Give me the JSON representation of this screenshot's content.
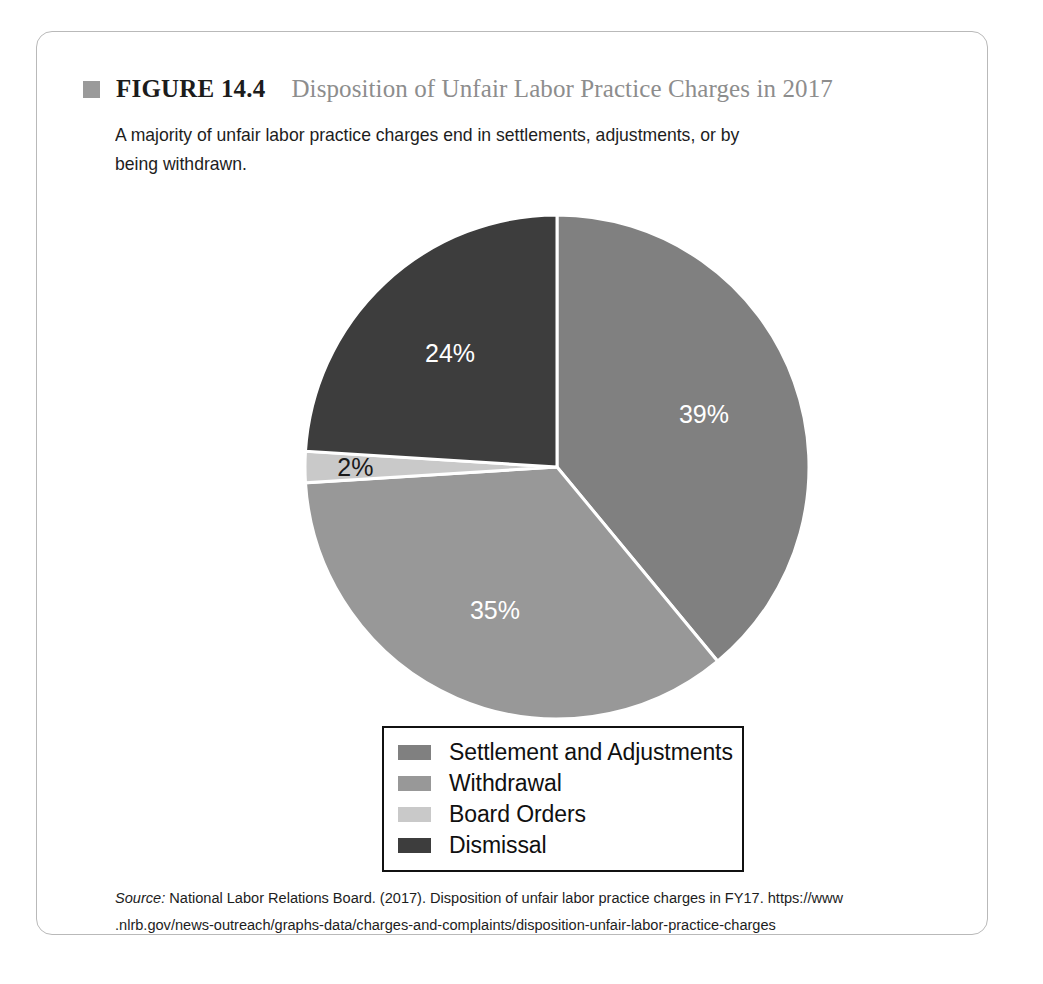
{
  "figure": {
    "number": "FIGURE 14.4",
    "title": "Disposition of Unfair Labor Practice Charges in 2017",
    "caption": "A majority of unfair labor practice charges end in settlements, adjustments, or by being withdrawn.",
    "source_word": "Source:",
    "source_text": " National Labor Relations Board. (2017). Disposition of unfair labor practice charges in FY17. https://www .nlrb.gov/news-outreach/graphs-data/charges-and-complaints/disposition-unfair-labor-practice-charges",
    "bullet_color": "#9a9a9a",
    "border_color": "#b9b9b9"
  },
  "chart_data": {
    "type": "pie",
    "title": "Disposition of Unfair Labor Practice Charges in 2017",
    "categories": [
      "Settlement and Adjustments",
      "Withdrawal",
      "Board Orders",
      "Dismissal"
    ],
    "values": [
      39,
      35,
      2,
      24
    ],
    "value_labels": [
      "39%",
      "35%",
      "2%",
      "24%"
    ],
    "unit": "percent",
    "colors": [
      "#808080",
      "#989898",
      "#c9c9c9",
      "#3d3d3d"
    ],
    "label_colors": [
      "#ffffff",
      "#ffffff",
      "#1a1a1a",
      "#ffffff"
    ],
    "start_angle_deg": 0,
    "direction": "clockwise",
    "separator_color": "#ffffff",
    "legend_position": "bottom",
    "grid": false
  },
  "legend": {
    "items": [
      {
        "label": "Settlement and Adjustments",
        "color": "#808080"
      },
      {
        "label": "Withdrawal",
        "color": "#989898"
      },
      {
        "label": "Board Orders",
        "color": "#c9c9c9"
      },
      {
        "label": "Dismissal",
        "color": "#3d3d3d"
      }
    ]
  }
}
